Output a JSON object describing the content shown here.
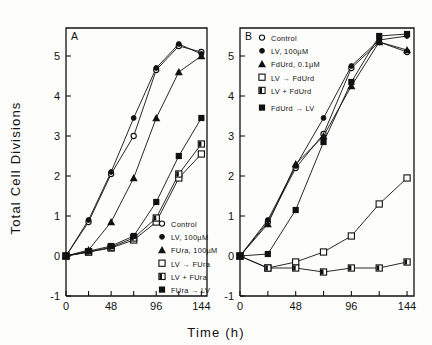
{
  "figure": {
    "xlabel": "Time (h)",
    "ylabel": "Total Cell Divisions"
  },
  "axes": {
    "xticks": [
      0,
      24,
      48,
      72,
      96,
      120,
      144
    ],
    "xticklabels": [
      "0",
      "",
      "48",
      "",
      "96",
      "",
      "144"
    ],
    "yticks": [
      -1,
      0,
      1,
      2,
      3,
      4,
      5
    ],
    "yticklabels": [
      "-1",
      "0",
      "1",
      "2",
      "3",
      "4",
      "5"
    ],
    "xlim": [
      0,
      150
    ],
    "ylim": [
      -1,
      5.7
    ]
  },
  "chart_data": [
    {
      "type": "scatter",
      "panel": "A",
      "title": "A",
      "xlabel": "Time (h)",
      "ylabel": "Total Cell Divisions",
      "xlim": [
        0,
        150
      ],
      "ylim": [
        -1,
        5.7
      ],
      "grid": false,
      "legend_position": "lower right",
      "x": [
        0,
        24,
        48,
        72,
        96,
        120,
        144
      ],
      "series": [
        {
          "name": "Control",
          "marker": "open-circle",
          "values": [
            0,
            0.85,
            2.05,
            3.0,
            4.65,
            5.25,
            5.1
          ]
        },
        {
          "name": "LV, 100µM",
          "marker": "filled-circle",
          "values": [
            0,
            0.9,
            2.1,
            3.45,
            4.7,
            5.3,
            5.05
          ]
        },
        {
          "name": "FUra, 100µM",
          "marker": "filled-triangle",
          "values": [
            0,
            0.15,
            0.85,
            1.95,
            3.45,
            4.6,
            5.0
          ]
        },
        {
          "name": "LV → FUra",
          "marker": "open-square",
          "values": [
            0,
            0.1,
            0.2,
            0.4,
            0.85,
            1.95,
            2.55
          ]
        },
        {
          "name": "LV + FUra",
          "marker": "half-square",
          "values": [
            0,
            0.1,
            0.22,
            0.45,
            0.95,
            2.05,
            2.8
          ]
        },
        {
          "name": "FUra → LV",
          "marker": "filled-square",
          "values": [
            0,
            0.12,
            0.25,
            0.5,
            1.35,
            2.5,
            3.45
          ]
        }
      ]
    },
    {
      "type": "scatter",
      "panel": "B",
      "title": "B",
      "xlabel": "Time (h)",
      "ylabel": "Total Cell Divisions",
      "xlim": [
        0,
        150
      ],
      "ylim": [
        -1,
        5.7
      ],
      "grid": false,
      "legend_position": "upper left",
      "x": [
        0,
        24,
        48,
        72,
        96,
        120,
        144
      ],
      "series": [
        {
          "name": "Control",
          "marker": "open-circle",
          "values": [
            0,
            0.85,
            2.2,
            3.05,
            4.7,
            5.35,
            5.1
          ]
        },
        {
          "name": "LV, 100µM",
          "marker": "filled-circle",
          "values": [
            0,
            0.9,
            2.25,
            3.45,
            4.75,
            5.4,
            5.5
          ]
        },
        {
          "name": "FdUrd, 0.1µM",
          "marker": "filled-triangle",
          "values": [
            0,
            0.8,
            2.3,
            3.0,
            4.25,
            5.35,
            5.15
          ]
        },
        {
          "name": "LV → FdUrd",
          "marker": "open-square",
          "values": [
            0,
            -0.3,
            -0.15,
            0.1,
            0.5,
            1.3,
            1.95
          ]
        },
        {
          "name": "LV + FdUrd",
          "marker": "half-square",
          "values": [
            0,
            -0.3,
            -0.3,
            -0.4,
            -0.3,
            -0.3,
            -0.15
          ]
        },
        {
          "name": "FdUrd → LV",
          "marker": "filled-square",
          "values": [
            0,
            0.05,
            1.15,
            2.85,
            4.35,
            5.5,
            5.55
          ]
        }
      ]
    }
  ]
}
